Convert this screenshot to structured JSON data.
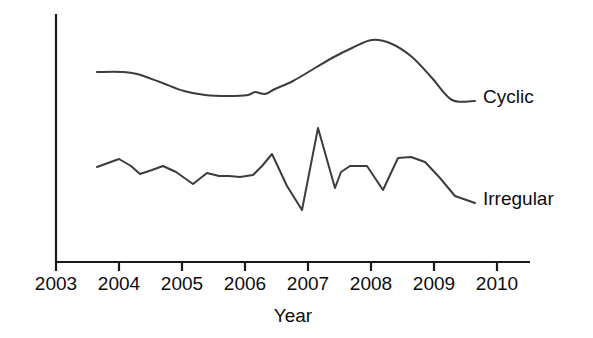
{
  "chart_data": {
    "type": "line",
    "title": "",
    "xlabel": "Year",
    "ylabel": "",
    "grid": false,
    "legend_position": "right-inline-labels",
    "xlim": [
      2003,
      2010
    ],
    "xticks": [
      2003,
      2004,
      2005,
      2006,
      2007,
      2008,
      2009,
      2010
    ],
    "xtick_labels": [
      "2003",
      "2004",
      "2005",
      "2006",
      "2007",
      "2008",
      "2009",
      "2010"
    ],
    "y_axis_visible": true,
    "y_axis_ticks_shown": false,
    "ylim": [
      0,
      100
    ],
    "series": [
      {
        "name": "Cyclic",
        "label": "Cyclic",
        "color": "#3c3c3c",
        "x": [
          2003.65,
          2004.0,
          2004.25,
          2004.6,
          2004.95,
          2005.3,
          2005.65,
          2006.0,
          2006.2,
          2006.45,
          2006.7,
          2007.0,
          2007.3,
          2007.55,
          2007.85,
          2008.15,
          2008.45,
          2008.75,
          2009.05,
          2009.35,
          2009.65
        ],
        "y": [
          80.0,
          80.0,
          79.0,
          75.0,
          71.0,
          69.5,
          69.0,
          70.5,
          70.0,
          72.5,
          76.5,
          81.0,
          86.5,
          88.5,
          89.0,
          90.0,
          87.5,
          80.0,
          71.0,
          68.5,
          68.5
        ],
        "x_pixels": [
          97,
          122,
          137,
          160,
          184,
          205,
          228,
          248,
          255,
          265,
          275,
          293,
          315,
          332,
          352,
          372,
          392,
          412,
          432,
          452,
          475
        ],
        "y_pixels": [
          72,
          72,
          74,
          82,
          91,
          95,
          96,
          95,
          92,
          94,
          89,
          81,
          68,
          58,
          48,
          40,
          44,
          57,
          78,
          100,
          101
        ]
      },
      {
        "name": "Irregular",
        "label": "Irregular",
        "color": "#3c3c3c",
        "x": [
          2003.65,
          2003.85,
          2004.05,
          2004.2,
          2004.4,
          2004.65,
          2004.85,
          2005.1,
          2005.3,
          2005.55,
          2005.75,
          2005.95,
          2006.15,
          2006.35,
          2006.55,
          2006.75,
          2006.95,
          2007.15,
          2007.35,
          2007.55,
          2007.75,
          2007.95,
          2008.15,
          2008.35,
          2008.55,
          2008.8,
          2009.05,
          2009.35,
          2009.65
        ],
        "y": [
          43.0,
          47.5,
          44.0,
          40.0,
          42.5,
          44.5,
          40.5,
          35.5,
          39.5,
          38.5,
          38.0,
          37.5,
          48.0,
          33.0,
          19.0,
          62.0,
          41.5,
          48.0,
          48.0,
          40.5,
          50.5,
          51.0,
          51.0,
          47.0,
          42.0,
          35.5,
          30.0,
          30.5,
          30.5
        ],
        "x_pixels": [
          97,
          119,
          131,
          140,
          152,
          163,
          176,
          193,
          207,
          219,
          229,
          240,
          253,
          262,
          272,
          287,
          302,
          318,
          335,
          341,
          350,
          358,
          367,
          383,
          398,
          411,
          425,
          440,
          455,
          475
        ],
        "y_pixels": [
          167,
          159,
          166,
          174,
          170,
          166,
          172,
          184,
          173,
          176,
          176,
          177,
          175,
          166,
          154,
          186,
          210,
          128,
          188,
          172,
          166,
          166,
          166,
          190,
          158,
          157,
          162,
          178,
          196,
          203
        ]
      }
    ]
  },
  "axis": {
    "x_axis_start_px": 56,
    "x_axis_end_px": 530,
    "x_axis_y_px": 262,
    "y_axis_x_px": 56,
    "y_axis_top_px": 14,
    "y_axis_bottom_px": 262,
    "tick_spacing_px": 63,
    "tick_length_px": 9,
    "tick_label_baseline_px": 290,
    "axis_title_x_px": 293,
    "axis_title_baseline_px": 322
  },
  "labels": {
    "cyclic": {
      "text": "Cyclic",
      "x_px": 483,
      "baseline_px": 103
    },
    "irregular": {
      "text": "Irregular",
      "x_px": 483,
      "baseline_px": 205
    }
  },
  "colors": {
    "background": "#ffffff",
    "axis": "#1a1a1a",
    "line": "#3c3c3c",
    "text": "#0d0d0d"
  }
}
